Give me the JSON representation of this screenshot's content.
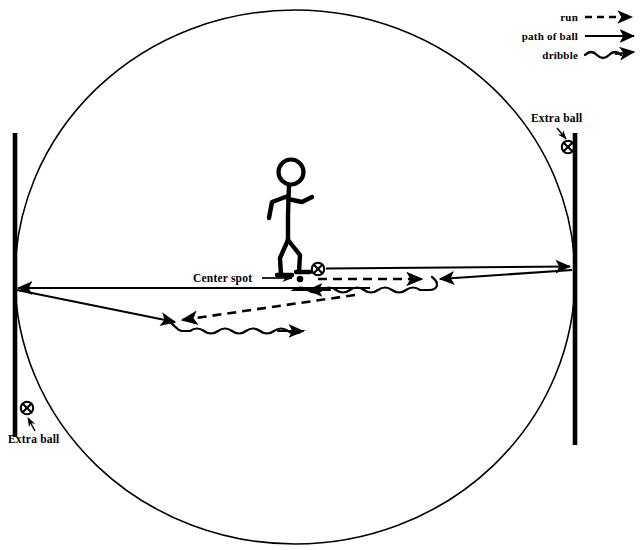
{
  "diagram": {
    "background_color": "#ffffff",
    "stroke_color": "#000000",
    "labels": {
      "center_spot": "Center spot",
      "extra_ball_top_right": "Extra ball",
      "extra_ball_bottom_left": "Extra ball"
    },
    "legend": {
      "items": [
        {
          "id": "run",
          "label": "run",
          "style": "dashed-arrow"
        },
        {
          "id": "path-of-ball",
          "label": "path of ball",
          "style": "solid-arrow"
        },
        {
          "id": "dribble",
          "label": "dribble",
          "style": "wavy-arrow"
        }
      ]
    },
    "field": {
      "circle": {
        "cx": 295,
        "cy": 277,
        "rx": 280,
        "ry": 267
      },
      "goal_lines": [
        {
          "id": "left-goal-line",
          "x": 15,
          "y1": 133,
          "y2": 437
        },
        {
          "id": "right-goal-line",
          "x": 575,
          "y1": 133,
          "y2": 445
        }
      ]
    },
    "markers": {
      "center_spot_dot": {
        "x": 300,
        "y": 279
      },
      "balls": [
        {
          "id": "ball-at-player-feet",
          "x": 318,
          "y": 269
        },
        {
          "id": "extra-ball-top-right",
          "x": 568,
          "y": 147
        },
        {
          "id": "extra-ball-bottom-left",
          "x": 27,
          "y": 408
        }
      ]
    },
    "player": {
      "id": "stick-figure-player",
      "head": {
        "cx": 291,
        "cy": 172,
        "r": 12
      }
    }
  }
}
